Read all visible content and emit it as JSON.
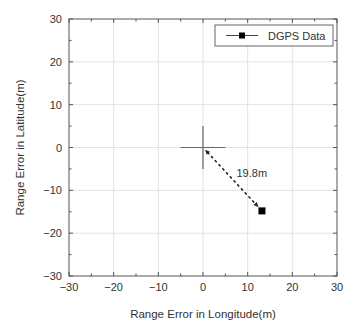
{
  "chart_data": {
    "type": "scatter",
    "title": "",
    "xlabel": "Range Error in Longitude(m)",
    "ylabel": "Range Error in Latitude(m)",
    "xlim": [
      -30,
      30
    ],
    "ylim": [
      -30,
      30
    ],
    "x_ticks": [
      -30,
      -20,
      -10,
      0,
      10,
      20,
      30
    ],
    "y_ticks": [
      -30,
      -20,
      -10,
      0,
      10,
      20,
      30
    ],
    "x_tick_labels": [
      "−30",
      "−20",
      "−10",
      "0",
      "10",
      "20",
      "30"
    ],
    "y_tick_labels": [
      "−30",
      "−20",
      "−10",
      "0",
      "10",
      "20",
      "30"
    ],
    "grid": true,
    "legend": {
      "position": "upper right",
      "entries": [
        "DGPS Data"
      ]
    },
    "series": [
      {
        "name": "DGPS Data",
        "marker": "square",
        "color": "#000000",
        "points": [
          {
            "x": 13.2,
            "y": -14.8
          }
        ]
      }
    ],
    "reference_point": {
      "x": 0,
      "y": 0,
      "marker": "crosshair",
      "half_size": 5
    },
    "annotations": [
      {
        "type": "dotted-arrow",
        "from": {
          "x": 0,
          "y": 0
        },
        "to": {
          "x": 13.2,
          "y": -14.8
        },
        "label": "19.8m",
        "label_pos": {
          "x": 7.5,
          "y": -6.0
        }
      }
    ]
  },
  "colors": {
    "axis": "#555555",
    "grid": "#e3e3e3",
    "text": "#333333",
    "marker": "#000000",
    "crosshair": "#666666"
  }
}
